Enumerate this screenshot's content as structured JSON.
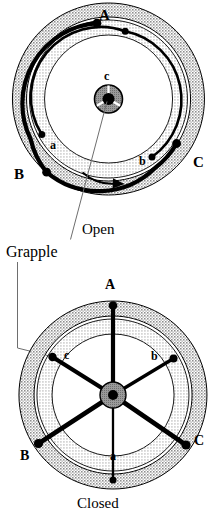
{
  "figure": {
    "callout": {
      "label": "Grapple"
    },
    "panels": [
      {
        "id": "open",
        "caption": "Open",
        "center": {
          "x": 108.5,
          "y": 99
        },
        "rotation_arrow": "clockwise",
        "outer_labels": [
          {
            "text": "A",
            "x": 99,
            "y": 8,
            "case": "upper"
          },
          {
            "text": "B",
            "x": 14,
            "y": 167,
            "case": "upper"
          },
          {
            "text": "C",
            "x": 193,
            "y": 155,
            "case": "upper"
          }
        ],
        "inner_labels": [
          {
            "text": "a",
            "x": 50,
            "y": 139,
            "case": "lower"
          },
          {
            "text": "b",
            "x": 139,
            "y": 155,
            "case": "lower"
          },
          {
            "text": "c",
            "x": 104,
            "y": 70,
            "case": "lower"
          }
        ]
      },
      {
        "id": "closed",
        "caption": "Closed",
        "center": {
          "x": 113,
          "y": 395
        },
        "outer_labels": [
          {
            "text": "A",
            "x": 105,
            "y": 278,
            "case": "upper"
          },
          {
            "text": "B",
            "x": 20,
            "y": 456,
            "case": "upper"
          },
          {
            "text": "C",
            "x": 193,
            "y": 441,
            "case": "upper"
          }
        ],
        "inner_labels": [
          {
            "text": "c",
            "x": 63,
            "y": 352,
            "case": "lower"
          },
          {
            "text": "b",
            "x": 151,
            "y": 353,
            "case": "lower"
          },
          {
            "text": "a",
            "x": 109,
            "y": 450,
            "case": "lower"
          }
        ]
      }
    ],
    "colors": {
      "ink": "#000000",
      "outer_band": "#c9c9c9",
      "inner_band": "#dcdcdc",
      "hub": "#9a9a9a",
      "background": "#ffffff",
      "leader": "#6e6e6e"
    },
    "geometry": {
      "open": {
        "r_outer_outer": 96,
        "r_outer_inner": 82,
        "r_inner_outer": 79,
        "r_inner_inner": 64,
        "hub_radius": 14,
        "hub_core_radius": 6
      },
      "closed": {
        "r_outer_outer": 94,
        "r_outer_inner": 79,
        "r_inner_outer": 76,
        "r_inner_inner": 61,
        "hub_radius": 13,
        "hub_core_radius": 5
      }
    }
  }
}
